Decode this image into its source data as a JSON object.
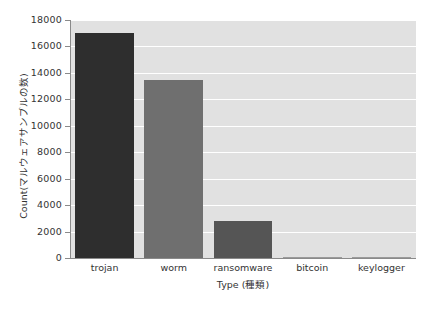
{
  "chart_data": {
    "type": "bar",
    "title": "",
    "categories": [
      "trojan",
      "worm",
      "ransomware",
      "bitcoin",
      "keylogger"
    ],
    "values": [
      17000,
      13500,
      2800,
      40,
      30
    ],
    "xlabel": "Type (種類)",
    "ylabel": "Count(マルウェアサンプルの数)",
    "ylim": [
      0,
      18000
    ],
    "ytick_labels": [
      "18000",
      "16000",
      "14000",
      "12000",
      "10000",
      "8000",
      "6000",
      "4000",
      "2000",
      "0"
    ],
    "ytick_values": [
      18000,
      16000,
      14000,
      12000,
      10000,
      8000,
      6000,
      4000,
      2000,
      0
    ],
    "grid": true,
    "legend": "none",
    "bar_colors": [
      "#2e2e2e",
      "#6f6f6f",
      "#555555",
      "#9a9a9a",
      "#9a9a9a"
    ],
    "plot_background": "#e1e1e1",
    "gridline_color": "#ffffff",
    "axis_color": "#8a8a8a",
    "text_color": "#333333"
  }
}
